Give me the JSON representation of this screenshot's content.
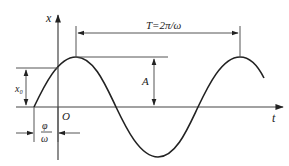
{
  "diagram": {
    "type": "simple-harmonic-motion-displacement-time-graph",
    "axes": {
      "vertical_label": "x",
      "horizontal_label": "t",
      "origin_label": "O"
    },
    "annotations": {
      "period": "T=2π/ω",
      "amplitude": "A",
      "initial_displacement": "x₀",
      "phase_shift_numerator": "φ",
      "phase_shift_denominator": "ω"
    },
    "colors": {
      "curve": "#222222",
      "lines": "#555555",
      "background": "#ffffff"
    }
  }
}
